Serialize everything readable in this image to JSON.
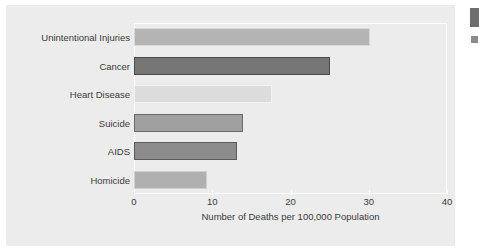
{
  "figure": {
    "background_color": "#ececed",
    "frame_color": "#ffffff",
    "text_color": "#3b3b3b"
  },
  "chart_data": {
    "type": "bar",
    "orientation": "horizontal",
    "title": "",
    "xlabel": "Number of Deaths per 100,000 Population",
    "ylabel": "",
    "xlim": [
      0,
      40
    ],
    "xticks": [
      0,
      10,
      20,
      30,
      40
    ],
    "xtick_labels": [
      "0",
      "10",
      "20",
      "30",
      "40"
    ],
    "grid": false,
    "legend": false,
    "categories": [
      "Unintentional Injuries",
      "Cancer",
      "Heart Disease",
      "Suicide",
      "AIDS",
      "Homicide"
    ],
    "values": [
      30.1,
      25.0,
      17.6,
      13.9,
      13.1,
      9.3
    ],
    "bar_colors": [
      "#b4b4b4",
      "#767676",
      "#dcdcdc",
      "#a0a0a0",
      "#8c8c8c",
      "#b0b0b0"
    ],
    "bar_edge_colors": [
      "#d8d8d8",
      "#4a4a4a",
      "#f2f2f2",
      "#6a6a6a",
      "#5a5a5a",
      "#cfcfcf"
    ]
  },
  "edge_fragments": {
    "top_color": "#6e6e6e",
    "bottom_color": "#8b8b8b"
  }
}
